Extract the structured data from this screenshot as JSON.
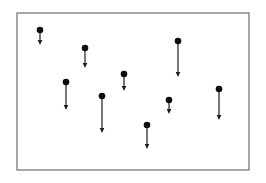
{
  "figure": {
    "canvas": {
      "width": 266,
      "height": 183,
      "background_color": "#ffffff"
    },
    "frame": {
      "x": 17,
      "y": 13,
      "width": 232,
      "height": 157,
      "border_color": "#787878",
      "border_width": 1.3,
      "fill_color": "#ffffff"
    },
    "style": {
      "dot_color": "#0d0d0d",
      "dot_radius": 3.3,
      "arrow_color": "#1c1c1c",
      "arrow_line_width": 1.2,
      "arrowhead_half_width": 2.3,
      "arrowhead_height": 5
    },
    "particles": [
      {
        "x": 40,
        "dot_y": 30,
        "arrow_tip_y": 45
      },
      {
        "x": 85,
        "dot_y": 48,
        "arrow_tip_y": 68
      },
      {
        "x": 178,
        "dot_y": 41,
        "arrow_tip_y": 77
      },
      {
        "x": 124,
        "dot_y": 74,
        "arrow_tip_y": 91
      },
      {
        "x": 66,
        "dot_y": 82,
        "arrow_tip_y": 110
      },
      {
        "x": 102,
        "dot_y": 96,
        "arrow_tip_y": 133
      },
      {
        "x": 169,
        "dot_y": 100,
        "arrow_tip_y": 114
      },
      {
        "x": 219,
        "dot_y": 89,
        "arrow_tip_y": 120
      },
      {
        "x": 147,
        "dot_y": 125,
        "arrow_tip_y": 149
      }
    ]
  }
}
